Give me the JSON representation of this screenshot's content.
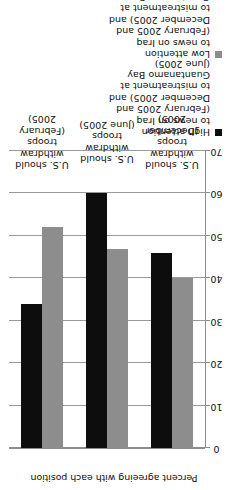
{
  "chart_data": {
    "type": "bar",
    "orientation": "horizontal",
    "title": "",
    "xlabel": "",
    "ylabel": "Percent agreeing with each position",
    "ylim": [
      0,
      70
    ],
    "ytick_step": 10,
    "yticks": [
      "0",
      "10",
      "20",
      "30",
      "40",
      "50",
      "60",
      "70"
    ],
    "grid": true,
    "legend_position": "right",
    "categories": [
      "U.S. should\nwithdraw troops\n(February 2005)",
      "U.S. should\nwithdraw troops\n(June 2005)",
      "U.S. should\nwithdraw troops\n(December 2005)"
    ],
    "series": [
      {
        "name": "High attention\nto news on Iraq\n(February 2005 and\nDecember 2005) and\nto mistreatment at\nGuantanamo Bay\n(June 2005)",
        "short_name": "high-attention",
        "color": "#0d0d0d",
        "values": [
          34,
          60,
          46
        ]
      },
      {
        "name": "Low attention\nto news on Iraq\n(February 2005 and\nDecember 2005) and\nto mistreatment at\nGuantanamo Bay\n(June 2005)",
        "short_name": "low-attention",
        "color": "#8d8d8d",
        "values": [
          52,
          47,
          40
        ]
      }
    ]
  },
  "axis": {
    "value_axis_title": "Percent agreeing with each position"
  }
}
